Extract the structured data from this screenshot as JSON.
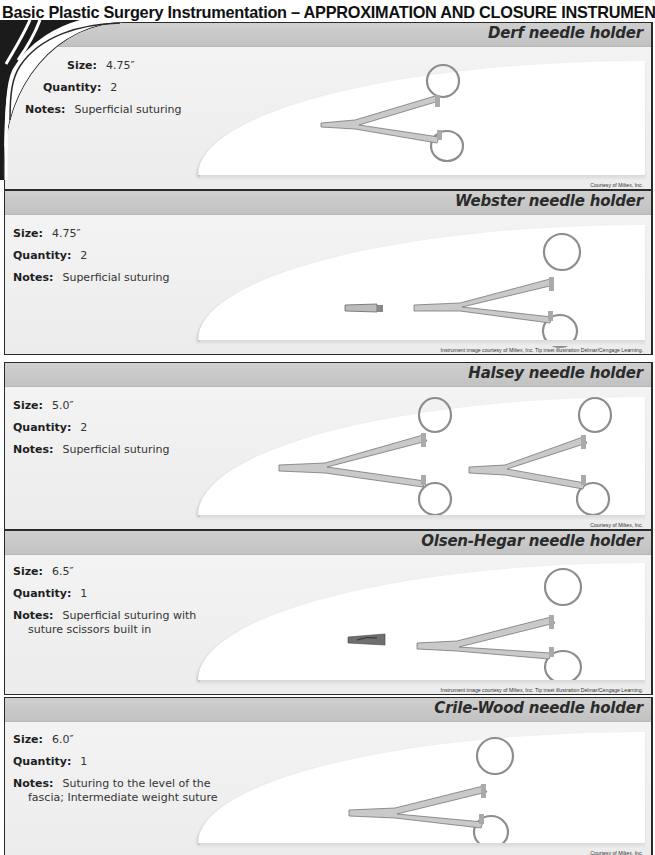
{
  "page": {
    "title": "Basic Plastic Surgery Instrumentation – APPROXIMATION AND CLOSURE INSTRUMENTS"
  },
  "labels": {
    "size": "Size:",
    "quantity": "Quantity:",
    "notes": "Notes:"
  },
  "instruments": [
    {
      "name": "Derf needle holder",
      "size": "4.75″",
      "quantity": "2",
      "notes_line1": "Superficial suturing",
      "notes_line2": "",
      "credit": "Courtesy of Miltex, Inc.",
      "has_tip_inset": false,
      "image_count": 1
    },
    {
      "name": "Webster needle holder",
      "size": "4.75″",
      "quantity": "2",
      "notes_line1": "Superficial suturing",
      "notes_line2": "",
      "credit": "Instrument image courtesy of Miltex, Inc. Tip inset illustration Delmar/Cengage Learning.",
      "has_tip_inset": true,
      "image_count": 1
    },
    {
      "name": "Halsey needle holder",
      "size": "5.0″",
      "quantity": "2",
      "notes_line1": "Superficial suturing",
      "notes_line2": "",
      "credit": "Courtesy of Miltex, Inc.",
      "has_tip_inset": false,
      "image_count": 2
    },
    {
      "name": "Olsen-Hegar needle holder",
      "size": "6.5″",
      "quantity": "1",
      "notes_line1": "Superficial suturing with",
      "notes_line2": "suture scissors built in",
      "credit": "Instrument image courtesy of Miltex, Inc. Tip inset illustration Delmar/Cengage Learning.",
      "has_tip_inset": true,
      "image_count": 1
    },
    {
      "name": "Crile-Wood needle holder",
      "size": "6.0″",
      "quantity": "1",
      "notes_line1": "Suturing to the level of the",
      "notes_line2": "fascia; Intermediate weight suture",
      "credit": "Courtesy of Miltex, Inc.",
      "has_tip_inset": false,
      "image_count": 1
    }
  ],
  "colors": {
    "header_band": "#c6c6c6",
    "panel_bg": "#f1f1f1",
    "border": "#2a2a2a",
    "decor_dark": "#1b1b1b"
  }
}
